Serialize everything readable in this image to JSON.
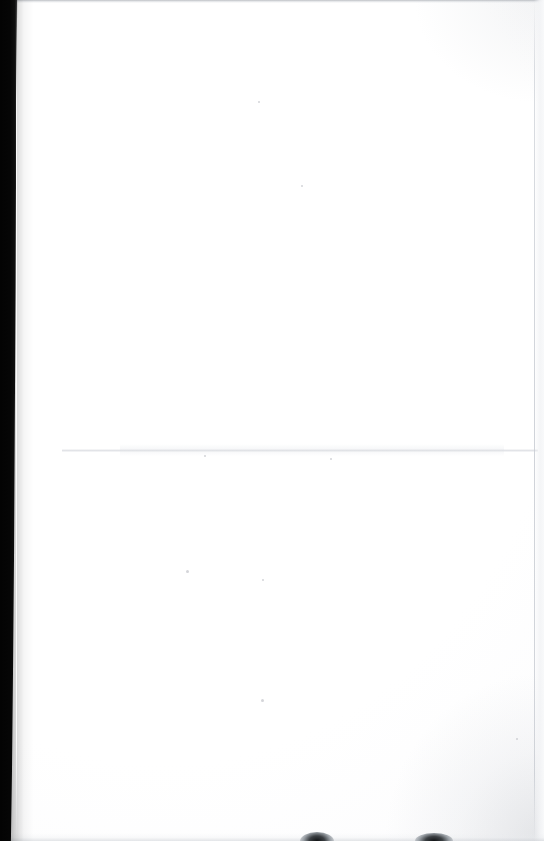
{
  "document": {
    "kind": "scanned-page",
    "page_state": "blank",
    "visible_text": "",
    "width_px": 544,
    "height_px": 841,
    "background_color": "#ffffff"
  },
  "artifacts": {
    "gutter_shadow": {
      "name": "left-scanner-gutter-shadow",
      "color": "#050505",
      "edge_color": "#8d8d8d",
      "position": "left",
      "top_width_px": 16,
      "bottom_width_px": 10
    },
    "top_edge_line": {
      "name": "top-edge-scan-line",
      "color": "#a8acb2",
      "thickness_px": 3
    },
    "right_edge_line": {
      "name": "right-paper-edge-line",
      "color": "#c8ccd3",
      "x_px": 534
    },
    "fold_crease": {
      "name": "horizontal-fold-crease",
      "color": "#dee0e4",
      "y_px": 450
    },
    "bottom_edge_wash": {
      "name": "bottom-edge-shadow-wash",
      "color": "#cdd0d5"
    },
    "corner_shading": {
      "name": "bottom-right-vignette",
      "color": "#b4b8be"
    }
  },
  "bottom_blobs": [
    {
      "name": "bottom-edge-blob-left",
      "x_px": 300,
      "width_px": 34,
      "height_px": 9,
      "color": "#111315"
    },
    {
      "name": "bottom-edge-blob-right",
      "x_px": 415,
      "width_px": 38,
      "height_px": 8,
      "color": "#111315"
    }
  ],
  "specks": [
    {
      "name": "dust-speck-1",
      "x_px": 258,
      "y_px": 101,
      "size_px": 2
    },
    {
      "name": "dust-speck-2",
      "x_px": 301,
      "y_px": 185,
      "size_px": 2
    },
    {
      "name": "dust-speck-3",
      "x_px": 186,
      "y_px": 570,
      "size_px": 3
    },
    {
      "name": "dust-speck-4",
      "x_px": 262,
      "y_px": 579,
      "size_px": 2
    },
    {
      "name": "dust-speck-5",
      "x_px": 261,
      "y_px": 699,
      "size_px": 3
    },
    {
      "name": "dust-speck-6",
      "x_px": 516,
      "y_px": 738,
      "size_px": 2
    },
    {
      "name": "dust-speck-7",
      "x_px": 204,
      "y_px": 455,
      "size_px": 2
    },
    {
      "name": "dust-speck-8",
      "x_px": 330,
      "y_px": 458,
      "size_px": 2
    }
  ],
  "caption": {
    "alt": "Blank scanned page"
  }
}
